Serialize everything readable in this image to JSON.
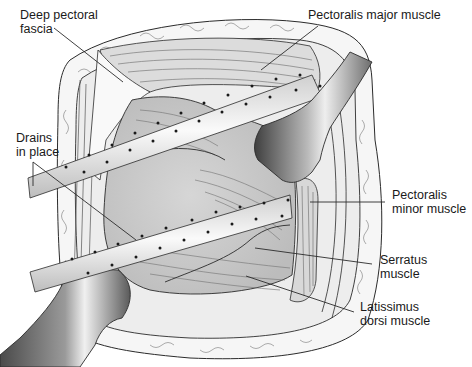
{
  "figure": {
    "labels": {
      "deep_pectoral_fascia": {
        "line1": "Deep pectoral",
        "line2": "fascia"
      },
      "pectoralis_major": {
        "line1": "Pectoralis major muscle"
      },
      "drains": {
        "line1": "Drains",
        "line2": "in place"
      },
      "pectoralis_minor": {
        "line1": "Pectoralis",
        "line2": "minor muscle"
      },
      "serratus": {
        "line1": "Serratus",
        "line2": "muscle"
      },
      "latissimus": {
        "line1": "Latissimus",
        "line2": "dorsi muscle"
      }
    },
    "colors": {
      "line": "#2b2b2b",
      "skin_fill": "#f4f4f4",
      "muscle_fill": "#d9d9d9",
      "cavity_fill": "#cfcfcf",
      "tube_fill": "#ececec",
      "retractor_dark": "#555555",
      "retractor_light": "#e6e6e6"
    }
  }
}
